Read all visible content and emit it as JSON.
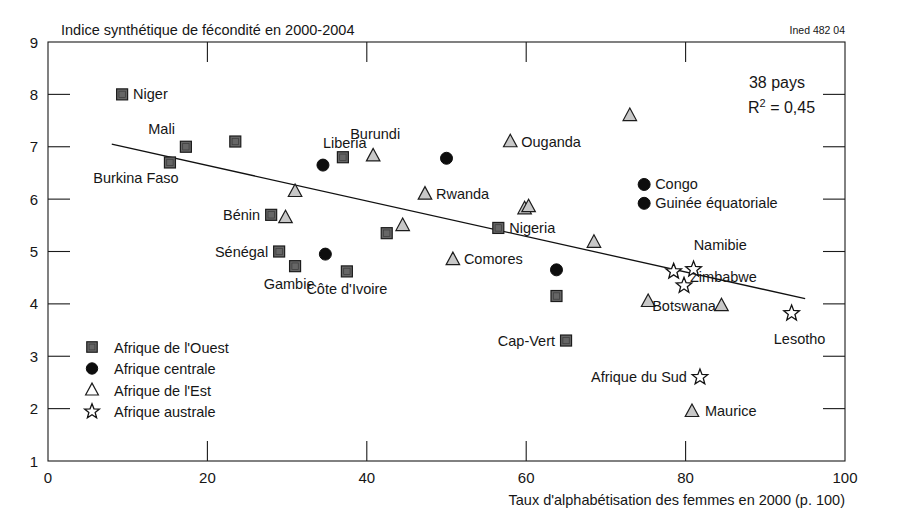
{
  "credit": "Ined 482 04",
  "annotations": {
    "countries": "38 pays",
    "r2_prefix": "R",
    "r2_exp": "2",
    "r2_value": " = 0,45"
  },
  "axes": {
    "y": {
      "title": "Indice synthétique de fécondité en 2000-2004",
      "ticks": [
        "9",
        "8",
        "7",
        "6",
        "5",
        "4",
        "3",
        "2",
        "1"
      ],
      "min": 1,
      "max": 9
    },
    "x": {
      "title": "Taux d'alphabétisation des femmes en 2000 (p. 100)",
      "ticks": [
        "0",
        "20",
        "40",
        "60",
        "80",
        "100"
      ],
      "min": 0,
      "max": 100
    }
  },
  "legend": {
    "items": [
      {
        "marker": "square",
        "label": "Afrique de l'Ouest",
        "color": "#666666"
      },
      {
        "marker": "circle",
        "label": "Afrique centrale",
        "color": "#0d0d0d"
      },
      {
        "marker": "triangle",
        "label": "Afrique de l'Est",
        "color": "#ffffff"
      },
      {
        "marker": "star",
        "label": "Afrique australe",
        "color": "#ffffff"
      }
    ]
  },
  "chart_data": {
    "type": "scatter",
    "title": "Indice synthétique de fécondité en 2000-2004",
    "xlabel": "Taux d'alphabétisation des femmes en 2000 (p. 100)",
    "ylabel": "Indice synthétique de fécondité en 2000-2004",
    "xlim": [
      0,
      100
    ],
    "ylim": [
      1,
      9
    ],
    "grid": false,
    "legend_position": "inside-bottom-left",
    "n_countries": 38,
    "r_squared": 0.45,
    "trendline": {
      "x": [
        8,
        95
      ],
      "y": [
        7.05,
        4.1
      ]
    },
    "series": [
      {
        "name": "Afrique de l'Ouest",
        "marker": "square",
        "points": [
          {
            "label": "Niger",
            "x": 9.3,
            "y": 8.0,
            "lpos": "right"
          },
          {
            "label": "Mali",
            "x": 17.3,
            "y": 7.0,
            "lpos": "upleft"
          },
          {
            "label": "Burkina Faso",
            "x": 15.3,
            "y": 6.7,
            "lpos": "below"
          },
          {
            "label": "",
            "x": 23.5,
            "y": 7.1,
            "lpos": "none"
          },
          {
            "label": "",
            "x": 37.0,
            "y": 6.8,
            "lpos": "none"
          },
          {
            "label": "Bénin",
            "x": 28.0,
            "y": 5.7,
            "lpos": "left"
          },
          {
            "label": "Sénégal",
            "x": 29.0,
            "y": 5.0,
            "lpos": "left"
          },
          {
            "label": "Gambie",
            "x": 31.0,
            "y": 4.72,
            "lpos": "below"
          },
          {
            "label": "Côte d'Ivoire",
            "x": 37.5,
            "y": 4.62,
            "lpos": "below"
          },
          {
            "label": "",
            "x": 42.5,
            "y": 5.35,
            "lpos": "none"
          },
          {
            "label": "Nigeria",
            "x": 56.5,
            "y": 5.45,
            "lpos": "right"
          },
          {
            "label": "",
            "x": 63.8,
            "y": 4.15,
            "lpos": "none"
          },
          {
            "label": "Cap-Vert",
            "x": 65.0,
            "y": 3.3,
            "lpos": "left"
          }
        ]
      },
      {
        "name": "Afrique centrale",
        "marker": "circle",
        "points": [
          {
            "label": "Liberia",
            "x": 34.5,
            "y": 6.65,
            "lpos": "upright"
          },
          {
            "label": "",
            "x": 34.8,
            "y": 4.95,
            "lpos": "none"
          },
          {
            "label": "",
            "x": 50.0,
            "y": 6.78,
            "lpos": "none"
          },
          {
            "label": "Congo",
            "x": 74.8,
            "y": 6.28,
            "lpos": "right"
          },
          {
            "label": "Guinée équatoriale",
            "x": 74.8,
            "y": 5.92,
            "lpos": "right"
          },
          {
            "label": "",
            "x": 63.8,
            "y": 4.65,
            "lpos": "none"
          }
        ]
      },
      {
        "name": "Afrique de l'Est",
        "marker": "triangle",
        "points": [
          {
            "label": "Burundi",
            "x": 40.8,
            "y": 6.83,
            "lpos": "up"
          },
          {
            "label": "",
            "x": 31.0,
            "y": 6.15,
            "lpos": "none"
          },
          {
            "label": "Rwanda",
            "x": 47.3,
            "y": 6.1,
            "lpos": "right"
          },
          {
            "label": "",
            "x": 29.8,
            "y": 5.65,
            "lpos": "none"
          },
          {
            "label": "",
            "x": 44.5,
            "y": 5.5,
            "lpos": "none"
          },
          {
            "label": "Ouganda",
            "x": 58.0,
            "y": 7.1,
            "lpos": "right"
          },
          {
            "label": "",
            "x": 73.0,
            "y": 7.6,
            "lpos": "none"
          },
          {
            "label": "",
            "x": 59.8,
            "y": 5.82,
            "lpos": "none"
          },
          {
            "label": "",
            "x": 60.3,
            "y": 5.86,
            "lpos": "none"
          },
          {
            "label": "Comores",
            "x": 50.8,
            "y": 4.85,
            "lpos": "right"
          },
          {
            "label": "",
            "x": 68.5,
            "y": 5.18,
            "lpos": "none"
          },
          {
            "label": "",
            "x": 75.3,
            "y": 4.05,
            "lpos": "none"
          },
          {
            "label": "Zimbabwe",
            "x": 84.5,
            "y": 3.97,
            "lpos": "up"
          },
          {
            "label": "Maurice",
            "x": 80.8,
            "y": 1.95,
            "lpos": "right"
          }
        ]
      },
      {
        "name": "Afrique australe",
        "marker": "star",
        "points": [
          {
            "label": "Namibie",
            "x": 78.5,
            "y": 4.62,
            "lpos": "upright"
          },
          {
            "label": "",
            "x": 81.0,
            "y": 4.66,
            "lpos": "none"
          },
          {
            "label": "Botswana",
            "x": 79.8,
            "y": 4.35,
            "lpos": "below"
          },
          {
            "label": "Lesotho",
            "x": 93.3,
            "y": 3.82,
            "lpos": "below"
          },
          {
            "label": "Afrique du Sud",
            "x": 81.8,
            "y": 2.6,
            "lpos": "left"
          }
        ]
      }
    ]
  }
}
